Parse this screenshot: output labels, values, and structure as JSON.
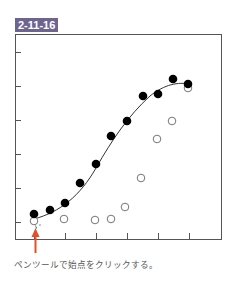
{
  "figure": {
    "label": "2-11-16",
    "label_color": "#6e6490",
    "caption": "ペンツールで始点をクリックする。"
  },
  "annotation": {
    "arrow_color": "#e0502a",
    "description": "red arrow pointing up at first point"
  },
  "chart_data": {
    "type": "scatter",
    "title": "",
    "xlabel": "",
    "ylabel": "",
    "x_ticks": 6,
    "y_ticks": 6,
    "tick_labels_visible": false,
    "grid": false,
    "legend": null,
    "series": [
      {
        "name": "filled",
        "marker": "filled-circle",
        "points": [
          [
            34,
            214
          ],
          [
            50,
            210
          ],
          [
            65,
            203
          ],
          [
            80,
            183
          ],
          [
            96,
            164
          ],
          [
            111,
            136
          ],
          [
            127,
            121
          ],
          [
            143,
            96
          ],
          [
            158,
            94
          ],
          [
            173,
            79
          ],
          [
            188,
            84
          ]
        ]
      },
      {
        "name": "open",
        "marker": "open-circle",
        "points": [
          [
            34,
            221
          ],
          [
            64,
            219
          ],
          [
            95,
            220
          ],
          [
            111,
            219
          ],
          [
            125,
            207
          ],
          [
            141,
            178
          ],
          [
            157,
            139
          ],
          [
            172,
            121
          ],
          [
            188,
            88
          ]
        ]
      }
    ],
    "curve": {
      "description": "smooth sigmoid path fitted through filled points",
      "path": "M34,219 C60,212 80,196 96,168 C112,140 128,116 150,96 C165,84 178,82 190,84"
    }
  }
}
